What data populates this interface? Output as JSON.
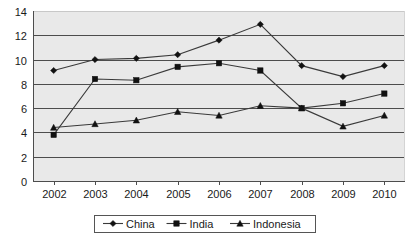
{
  "chart_data": {
    "type": "line",
    "title": "",
    "xlabel": "",
    "ylabel": "",
    "categories": [
      "2002",
      "2003",
      "2004",
      "2005",
      "2006",
      "2007",
      "2008",
      "2009",
      "2010"
    ],
    "ylim": [
      0,
      14
    ],
    "ytick_step": 2,
    "yticks": [
      "0",
      "2",
      "4",
      "6",
      "8",
      "10",
      "12",
      "14"
    ],
    "grid": "horizontal",
    "legend_position": "bottom",
    "series": [
      {
        "name": "China",
        "marker": "diamond",
        "values": [
          9.1,
          10.0,
          10.1,
          10.4,
          11.6,
          12.9,
          9.5,
          8.6,
          9.5
        ]
      },
      {
        "name": "India",
        "marker": "square",
        "values": [
          3.8,
          8.4,
          8.3,
          9.4,
          9.7,
          9.1,
          6.0,
          6.4,
          7.2
        ]
      },
      {
        "name": "Indonesia",
        "marker": "triangle",
        "values": [
          4.4,
          4.7,
          5.0,
          5.7,
          5.4,
          6.2,
          6.0,
          4.5,
          5.4
        ]
      }
    ]
  },
  "legend": {
    "items": [
      {
        "label": "China"
      },
      {
        "label": "India"
      },
      {
        "label": "Indonesia"
      }
    ]
  },
  "colors": {
    "plot_background": "#e9e9e9",
    "gridline": "#4d4d4d",
    "series_line": "#3a3a3a",
    "marker": "#111111",
    "text": "#1a1a1a",
    "page_background": "#ffffff"
  }
}
